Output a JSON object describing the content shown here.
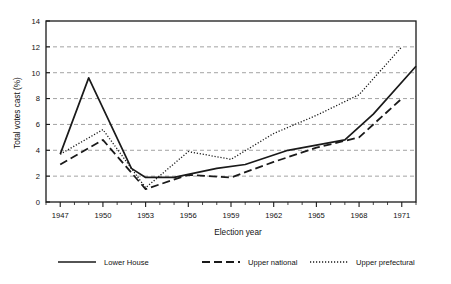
{
  "chart_data": {
    "type": "line",
    "title": "",
    "xlabel": "Election year",
    "ylabel": "Total votes cast (%)",
    "xlim": [
      1946,
      1972
    ],
    "ylim": [
      0,
      14
    ],
    "ytick_step": 2,
    "yticks": [
      0,
      2,
      4,
      6,
      8,
      10,
      12,
      14
    ],
    "ytick_labels": [
      "0",
      "2",
      "4",
      "6",
      "8",
      "10",
      "12",
      "14"
    ],
    "xticks": [
      1947,
      1950,
      1953,
      1956,
      1959,
      1962,
      1965,
      1968,
      1971
    ],
    "xtick_labels": [
      "1947",
      "1950",
      "1953",
      "1956",
      "1959",
      "1962",
      "1965",
      "1968",
      "1971"
    ],
    "xminor_step": 1,
    "grid": "horizontal-dashed",
    "legend_position": "bottom",
    "series": [
      {
        "name": "Lower House",
        "style": "solid",
        "color": "#1a1a1a",
        "points": [
          {
            "x": 1947,
            "y": 3.7
          },
          {
            "x": 1949,
            "y": 9.6
          },
          {
            "x": 1952,
            "y": 2.6
          },
          {
            "x": 1953,
            "y": 1.9
          },
          {
            "x": 1955,
            "y": 1.9
          },
          {
            "x": 1958,
            "y": 2.6
          },
          {
            "x": 1960,
            "y": 2.9
          },
          {
            "x": 1963,
            "y": 4.0
          },
          {
            "x": 1967,
            "y": 4.8
          },
          {
            "x": 1969,
            "y": 6.8
          },
          {
            "x": 1972,
            "y": 10.5
          }
        ]
      },
      {
        "name": "Upper national",
        "style": "dashed",
        "color": "#1a1a1a",
        "points": [
          {
            "x": 1947,
            "y": 2.9
          },
          {
            "x": 1950,
            "y": 4.8
          },
          {
            "x": 1953,
            "y": 1.0
          },
          {
            "x": 1956,
            "y": 2.1
          },
          {
            "x": 1959,
            "y": 1.9
          },
          {
            "x": 1962,
            "y": 3.1
          },
          {
            "x": 1965,
            "y": 4.2
          },
          {
            "x": 1968,
            "y": 5.0
          },
          {
            "x": 1971,
            "y": 8.0
          }
        ]
      },
      {
        "name": "Upper prefectural",
        "style": "dotted",
        "color": "#1a1a1a",
        "points": [
          {
            "x": 1947,
            "y": 3.7
          },
          {
            "x": 1950,
            "y": 5.6
          },
          {
            "x": 1953,
            "y": 1.1
          },
          {
            "x": 1956,
            "y": 3.9
          },
          {
            "x": 1959,
            "y": 3.3
          },
          {
            "x": 1962,
            "y": 5.3
          },
          {
            "x": 1965,
            "y": 6.7
          },
          {
            "x": 1968,
            "y": 8.3
          },
          {
            "x": 1971,
            "y": 12.0
          }
        ]
      }
    ]
  },
  "legend": {
    "items": [
      {
        "label": "Lower House",
        "style": "solid"
      },
      {
        "label": "Upper national",
        "style": "dashed"
      },
      {
        "label": "Upper prefectural",
        "style": "dotted"
      }
    ]
  }
}
